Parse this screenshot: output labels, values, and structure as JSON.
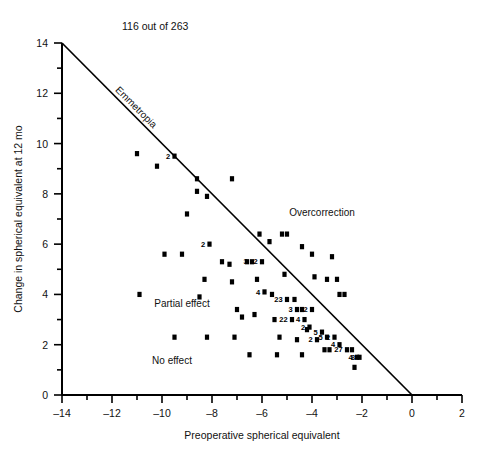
{
  "header": {
    "count_text": "116 out of 263"
  },
  "chart_data": {
    "type": "scatter",
    "title": "116 out of 263",
    "xlabel": "Preoperative spherical equivalent",
    "ylabel": "Change in spherical equivalent at 12 mo",
    "xlim": [
      -14,
      2
    ],
    "ylim": [
      0,
      14
    ],
    "xticks": [
      -14,
      -12,
      -10,
      -8,
      -6,
      -4,
      -2,
      0,
      2
    ],
    "xtick_labels": [
      "–14",
      "–12",
      "–10",
      "–8",
      "–6",
      "–4",
      "–2",
      "0",
      "2"
    ],
    "xminor_step": 1,
    "yticks": [
      0,
      2,
      4,
      6,
      8,
      10,
      12,
      14
    ],
    "ytick_labels": [
      "0",
      "2",
      "4",
      "6",
      "8",
      "10",
      "12",
      "14"
    ],
    "yminor_step": 1,
    "grid": false,
    "legend": "none",
    "reference_line": {
      "label": "Emmetropia",
      "from": [
        -14,
        14
      ],
      "to": [
        0,
        0
      ],
      "description": "y = -x line of full correction"
    },
    "annotations": [
      {
        "text": "Overcorrection",
        "x": -3.6,
        "y": 7.1
      },
      {
        "text": "Partial effect",
        "x": -9.2,
        "y": 3.5
      },
      {
        "text": "No effect",
        "x": -9.6,
        "y": 1.25
      }
    ],
    "points": [
      {
        "x": -11.0,
        "y": 9.6
      },
      {
        "x": -10.2,
        "y": 9.1
      },
      {
        "x": -9.5,
        "y": 9.5,
        "n": 2
      },
      {
        "x": -8.6,
        "y": 8.6
      },
      {
        "x": -7.2,
        "y": 8.6
      },
      {
        "x": -9.0,
        "y": 7.2
      },
      {
        "x": -8.6,
        "y": 8.1
      },
      {
        "x": -8.2,
        "y": 7.9
      },
      {
        "x": -8.1,
        "y": 6.0,
        "n": 2
      },
      {
        "x": -9.9,
        "y": 5.6
      },
      {
        "x": -9.2,
        "y": 5.6
      },
      {
        "x": -8.3,
        "y": 4.6
      },
      {
        "x": -8.5,
        "y": 3.9
      },
      {
        "x": -8.2,
        "y": 2.3
      },
      {
        "x": -10.9,
        "y": 4.0
      },
      {
        "x": -7.6,
        "y": 5.3
      },
      {
        "x": -7.3,
        "y": 5.2
      },
      {
        "x": -7.2,
        "y": 4.5
      },
      {
        "x": -7.1,
        "y": 2.3
      },
      {
        "x": -6.6,
        "y": 5.3
      },
      {
        "x": -6.4,
        "y": 5.3,
        "n": 3
      },
      {
        "x": -6.0,
        "y": 5.3,
        "n": 2
      },
      {
        "x": -6.2,
        "y": 4.6
      },
      {
        "x": -6.1,
        "y": 6.4
      },
      {
        "x": -5.9,
        "y": 4.1,
        "n": 4
      },
      {
        "x": -5.6,
        "y": 4.0
      },
      {
        "x": -5.5,
        "y": 3.0
      },
      {
        "x": -5.2,
        "y": 6.4
      },
      {
        "x": -5.1,
        "y": 4.8
      },
      {
        "x": -5.0,
        "y": 3.8,
        "n": 23
      },
      {
        "x": -4.7,
        "y": 3.8
      },
      {
        "x": -4.6,
        "y": 3.4,
        "n": 3
      },
      {
        "x": -4.4,
        "y": 3.4
      },
      {
        "x": -4.8,
        "y": 3.0,
        "n": 22
      },
      {
        "x": -4.3,
        "y": 3.0,
        "n": 4
      },
      {
        "x": -4.0,
        "y": 3.4,
        "n": 2
      },
      {
        "x": -4.2,
        "y": 2.6
      },
      {
        "x": -4.6,
        "y": 2.2
      },
      {
        "x": -5.3,
        "y": 2.3
      },
      {
        "x": -6.3,
        "y": 3.2
      },
      {
        "x": -6.8,
        "y": 3.1
      },
      {
        "x": -7.0,
        "y": 3.4
      },
      {
        "x": -4.1,
        "y": 2.7,
        "n": 2
      },
      {
        "x": -3.6,
        "y": 2.5,
        "n": 5
      },
      {
        "x": -3.4,
        "y": 2.3,
        "n": 5
      },
      {
        "x": -3.1,
        "y": 2.3,
        "n": 2
      },
      {
        "x": -3.8,
        "y": 2.2,
        "n": 2
      },
      {
        "x": -2.9,
        "y": 2.0,
        "n": 4
      },
      {
        "x": -2.6,
        "y": 1.8,
        "n": 27
      },
      {
        "x": -2.4,
        "y": 1.8
      },
      {
        "x": -2.2,
        "y": 1.5,
        "n": 4
      },
      {
        "x": -2.1,
        "y": 1.5,
        "n": 8
      },
      {
        "x": -2.3,
        "y": 1.1
      },
      {
        "x": -3.3,
        "y": 1.8
      },
      {
        "x": -3.5,
        "y": 1.8
      },
      {
        "x": -4.4,
        "y": 1.6
      },
      {
        "x": -5.4,
        "y": 1.6
      },
      {
        "x": -6.5,
        "y": 1.6
      },
      {
        "x": -9.5,
        "y": 2.3
      },
      {
        "x": -3.9,
        "y": 4.7
      },
      {
        "x": -3.4,
        "y": 4.6
      },
      {
        "x": -3.0,
        "y": 4.6
      },
      {
        "x": -3.2,
        "y": 5.5
      },
      {
        "x": -4.0,
        "y": 5.6
      },
      {
        "x": -4.4,
        "y": 5.9
      },
      {
        "x": -2.9,
        "y": 4.0
      },
      {
        "x": -2.7,
        "y": 4.0
      },
      {
        "x": -5.7,
        "y": 6.1
      },
      {
        "x": -5.0,
        "y": 6.4
      }
    ]
  }
}
